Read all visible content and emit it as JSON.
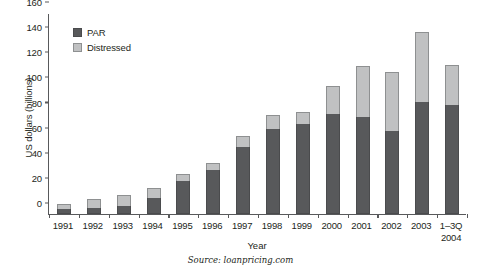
{
  "chart_data": {
    "type": "bar",
    "stacked": true,
    "title": "",
    "xlabel": "Year",
    "ylabel": "US dollars (billions)",
    "ylim": [
      0,
      160
    ],
    "ytick_step": 20,
    "yticks": [
      0,
      20,
      40,
      60,
      80,
      100,
      120,
      140,
      160
    ],
    "ytick_labels": [
      "0",
      "20",
      "40",
      "60",
      "80",
      "100",
      "120",
      "140",
      "160"
    ],
    "grid": false,
    "legend_position": "upper-left-inside",
    "categories": [
      "1991",
      "1992",
      "1993",
      "1994",
      "1995",
      "1996",
      "1997",
      "1998",
      "1999",
      "2000",
      "2001",
      "2002",
      "2003",
      "1–3Q\n2004"
    ],
    "category_labels": [
      {
        "line1": "1991",
        "line2": ""
      },
      {
        "line1": "1992",
        "line2": ""
      },
      {
        "line1": "1993",
        "line2": ""
      },
      {
        "line1": "1994",
        "line2": ""
      },
      {
        "line1": "1995",
        "line2": ""
      },
      {
        "line1": "1996",
        "line2": ""
      },
      {
        "line1": "1997",
        "line2": ""
      },
      {
        "line1": "1998",
        "line2": ""
      },
      {
        "line1": "1999",
        "line2": ""
      },
      {
        "line1": "2000",
        "line2": ""
      },
      {
        "line1": "2001",
        "line2": ""
      },
      {
        "line1": "2002",
        "line2": ""
      },
      {
        "line1": "2003",
        "line2": ""
      },
      {
        "line1": "1–3Q",
        "line2": "2004"
      }
    ],
    "series": [
      {
        "name": "PAR",
        "color": "#58595b",
        "values": [
          4,
          5,
          6,
          13,
          26,
          35,
          53,
          68,
          72,
          80,
          77,
          66,
          89,
          87
        ]
      },
      {
        "name": "Distressed",
        "color": "#c0c1c2",
        "values": [
          4,
          7,
          9,
          8,
          6,
          6,
          9,
          11,
          9,
          22,
          41,
          47,
          56,
          32
        ]
      }
    ],
    "totals": [
      8,
      12,
      15,
      21,
      32,
      41,
      62,
      79,
      81,
      102,
      118,
      113,
      145,
      119
    ],
    "annotations": []
  },
  "legend": {
    "items": [
      {
        "label": "PAR",
        "swatch": "par"
      },
      {
        "label": "Distressed",
        "swatch": "distressed"
      }
    ]
  },
  "axes": {
    "y_title": "US dollars (billions)",
    "x_title": "Year"
  },
  "source": {
    "text": "Source: loanpricing.com"
  },
  "colors": {
    "par": "#58595b",
    "distressed": "#c0c1c2",
    "axis": "#58595b",
    "text": "#231f20",
    "background": "#ffffff"
  }
}
